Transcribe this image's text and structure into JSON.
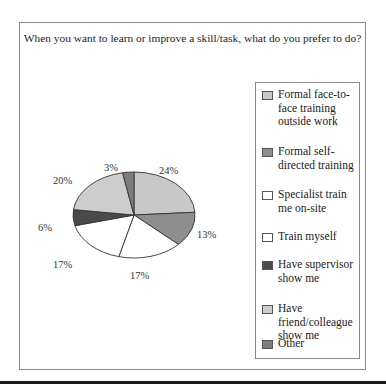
{
  "chart_data": {
    "type": "pie",
    "title": "When you want to learn or improve a skill/task, what do you prefer to do?",
    "categories": [
      "Formal face-to-face training outside work",
      "Formal self-directed training",
      "Specialist train me on-site",
      "Train myself",
      "Have supervisor show me",
      "Have friend/colleague show me",
      "Other"
    ],
    "values": [
      24,
      13,
      17,
      17,
      6,
      20,
      3
    ],
    "labels": [
      "24%",
      "13%",
      "17%",
      "17%",
      "6%",
      "20%",
      "3%"
    ],
    "colors": [
      "#c8c8c8",
      "#8e8e8e",
      "#ffffff",
      "#ffffff",
      "#4a4a4a",
      "#cdcdcd",
      "#7d7d7d"
    ],
    "legend_position": "right",
    "start_angle": "top, clockwise"
  },
  "legend": {
    "items": [
      {
        "label": "Formal face-to-face training outside work",
        "color": "#c8c8c8"
      },
      {
        "label": "Formal self-directed training",
        "color": "#8e8e8e"
      },
      {
        "label": "Specialist train me on-site",
        "color": "#ffffff"
      },
      {
        "label": "Train myself",
        "color": "#ffffff"
      },
      {
        "label": "Have supervisor show me",
        "color": "#4a4a4a"
      },
      {
        "label": "Have friend/colleague show me",
        "color": "#cdcdcd"
      },
      {
        "label": "Other",
        "color": "#7d7d7d"
      }
    ]
  }
}
